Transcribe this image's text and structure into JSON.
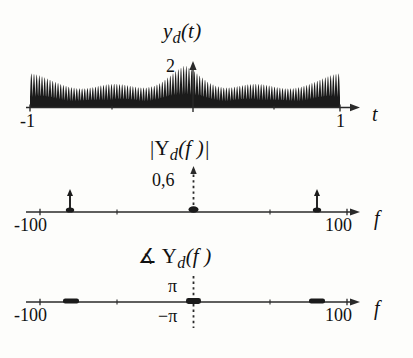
{
  "figure": {
    "kind": "signal-processing-spectra",
    "background": "#fdfdfb",
    "ink_color": "#1b1b1b"
  },
  "panels": {
    "time": {
      "title_main": "y",
      "title_sub": "d",
      "title_tail": "(t)",
      "peak_label": "2",
      "x_left_label": "-1",
      "x_right_label": "1",
      "axis_var": "t"
    },
    "magnitude": {
      "title_pre": "|Y",
      "title_sub": "d",
      "title_tail": "(f )|",
      "peak_label": "0,6",
      "x_left_label": "-100",
      "x_right_label": "100",
      "axis_var": "f"
    },
    "phase": {
      "title_pre": "∡ Y",
      "title_sub": "d",
      "title_tail": "(f )",
      "pos_label": "π",
      "neg_label": "−π",
      "x_left_label": "-100",
      "x_right_label": "100",
      "axis_var": "f"
    }
  },
  "chart_data": [
    {
      "type": "area",
      "name": "y_d(t) time-domain waveform",
      "title": "y_d(t)",
      "xlabel": "t",
      "ylabel": "",
      "xlim": [
        -1,
        1
      ],
      "ylim": [
        0,
        2.15
      ],
      "grid": false,
      "legend": false,
      "description": "Rectified / envelope-modulated carrier: dense oscillation filled solid black, envelope shows beating with maxima at t = -1, -0.5, 0, 0.5, 1 and the global maximum of 2 at t = 0.",
      "annotations": [
        {
          "text": "2",
          "x": 0,
          "y": 2,
          "note": "peak amplitude marker at the vertical arrow"
        },
        {
          "text": "-1",
          "x": -1,
          "y": 0
        },
        {
          "text": "1",
          "x": 1,
          "y": 0
        }
      ],
      "envelope_x": [
        -1.0,
        -0.95,
        -0.9,
        -0.85,
        -0.8,
        -0.75,
        -0.7,
        -0.65,
        -0.6,
        -0.55,
        -0.5,
        -0.45,
        -0.4,
        -0.35,
        -0.3,
        -0.25,
        -0.2,
        -0.15,
        -0.1,
        -0.05,
        0.0,
        0.05,
        0.1,
        0.15,
        0.2,
        0.25,
        0.3,
        0.35,
        0.4,
        0.45,
        0.5,
        0.55,
        0.6,
        0.65,
        0.7,
        0.75,
        0.8,
        0.85,
        0.9,
        0.95,
        1.0
      ],
      "envelope_y": [
        1.62,
        1.55,
        1.41,
        1.25,
        1.1,
        0.98,
        0.91,
        0.9,
        0.95,
        1.03,
        1.1,
        1.12,
        1.09,
        1.02,
        0.95,
        0.94,
        1.02,
        1.2,
        1.48,
        1.78,
        2.0,
        1.78,
        1.48,
        1.2,
        1.02,
        0.94,
        0.95,
        1.02,
        1.09,
        1.12,
        1.1,
        1.03,
        0.95,
        0.9,
        0.91,
        0.98,
        1.1,
        1.25,
        1.41,
        1.55,
        1.62
      ],
      "carrier_cycles": 58
    },
    {
      "type": "bar",
      "name": "|Y_d(f)| magnitude spectrum",
      "title": "|Y_d(f)|",
      "xlabel": "f",
      "ylabel": "",
      "xlim": [
        -110,
        110
      ],
      "ylim": [
        0,
        0.68
      ],
      "grid": false,
      "legend": false,
      "description": "Line spectrum: a dominant impulse of height 0,6 at f = 0 and two smaller symmetric impulses near f = ±75.",
      "x": [
        -75,
        0,
        75
      ],
      "values": [
        0.16,
        0.6,
        0.16
      ],
      "xticks": [
        -100,
        -50,
        0,
        50,
        100
      ],
      "xticklabels": [
        "-100",
        "",
        "",
        "",
        "100"
      ],
      "annotations": [
        {
          "text": "0,6",
          "x": 0,
          "y": 0.6
        },
        {
          "text": "-100",
          "x": -100,
          "y": 0
        },
        {
          "text": "100",
          "x": 100,
          "y": 0
        }
      ]
    },
    {
      "type": "bar",
      "name": "∡Y_d(f) phase spectrum",
      "title": "∡ Y_d(f)",
      "xlabel": "f",
      "ylabel": "",
      "xlim": [
        -110,
        110
      ],
      "ylim": [
        -3.6,
        3.6
      ],
      "grid": false,
      "legend": false,
      "description": "Phase is essentially zero everywhere; short thick segments mark the components at f ≈ -75, 0 and +75 lying on the zero line. Dotted reference line at f = 0 spans from −π to π.",
      "x": [
        -75,
        0,
        75
      ],
      "values": [
        0,
        0,
        0
      ],
      "yticks": [
        3.14159,
        -3.14159
      ],
      "yticklabels": [
        "π",
        "−π"
      ],
      "xticks": [
        -100,
        -50,
        0,
        50,
        100
      ],
      "xticklabels": [
        "-100",
        "",
        "",
        "",
        "100"
      ],
      "annotations": [
        {
          "text": "π",
          "x": 0,
          "y": 3.14159
        },
        {
          "text": "−π",
          "x": 0,
          "y": -3.14159
        },
        {
          "text": "-100",
          "x": -100,
          "y": 0
        },
        {
          "text": "100",
          "x": 100,
          "y": 0
        }
      ]
    }
  ]
}
